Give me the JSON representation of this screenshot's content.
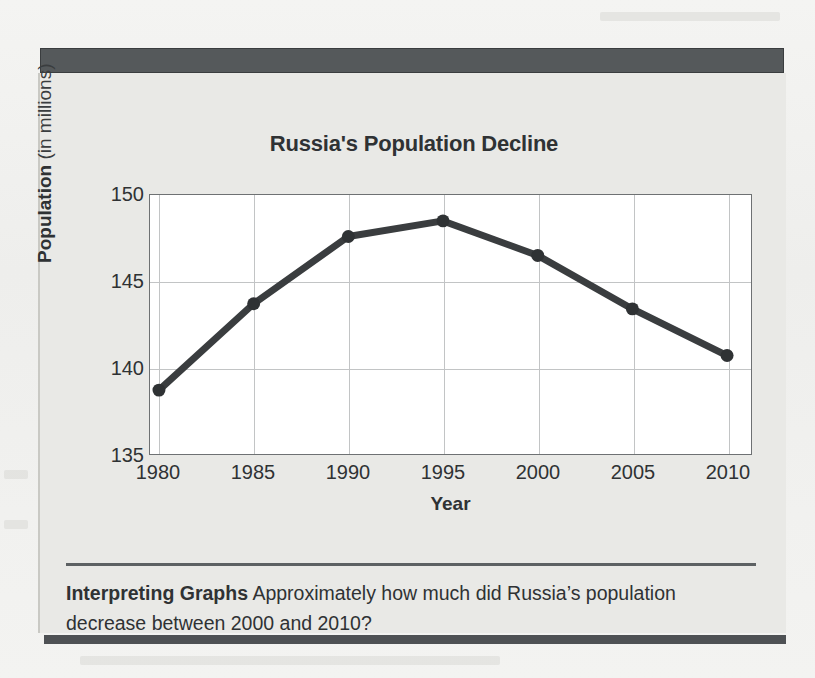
{
  "figure": {
    "title": "Russia's Population Decline",
    "caption_label": "Interpreting Graphs",
    "caption_text": "Approximately how much did Russia’s population decrease between 2000 and 2010?"
  },
  "axis": {
    "ylabel_bold": "Population",
    "ylabel_rest": " (in millions)",
    "xlabel": "Year"
  },
  "colors": {
    "line": "#3a3d3f",
    "marker": "#2f3234",
    "panel_bg": "#e9e9e6",
    "topbar": "#55595b",
    "grid": "#c2c4c5",
    "plot_bg": "#ffffff",
    "text": "#2f3234"
  },
  "chart_data": {
    "type": "line",
    "title": "Russia's Population Decline",
    "xlabel": "Year",
    "ylabel": "Population (in millions)",
    "x": [
      1980,
      1985,
      1990,
      1995,
      2000,
      2005,
      2010
    ],
    "xtick_labels": [
      "1980",
      "1985",
      "1990",
      "1995",
      "2000",
      "2005",
      "2010"
    ],
    "values": [
      138.7,
      143.7,
      147.6,
      148.5,
      146.5,
      143.4,
      140.7
    ],
    "ytick_labels": [
      "135",
      "140",
      "145",
      "150"
    ],
    "yticks": [
      135,
      140,
      145,
      150
    ],
    "xlim": [
      1978,
      2011.5
    ],
    "ylim": [
      135,
      150
    ],
    "grid": true,
    "legend": "none",
    "markers": true
  }
}
